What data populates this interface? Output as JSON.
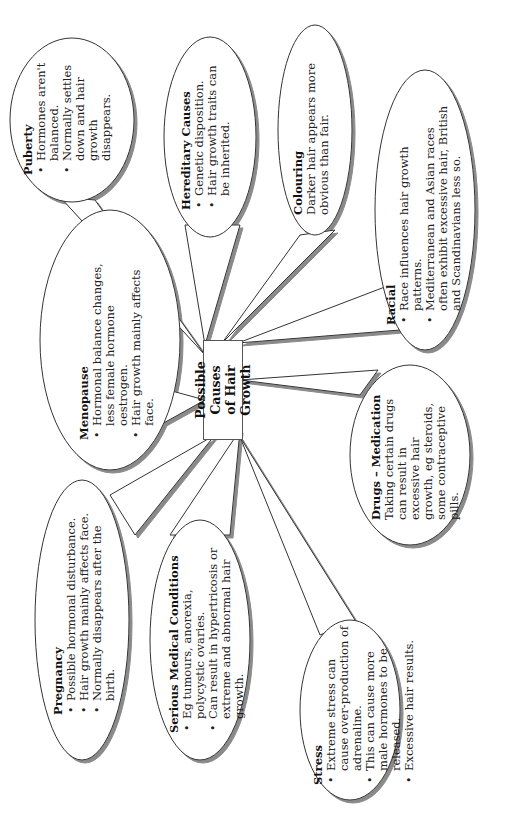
{
  "center": {
    "line1": "Possible Causes",
    "line2": "of Hair Growth"
  },
  "bubbles": {
    "puberty": {
      "title": "Puberty",
      "bullets": [
        "Hormones aren't balanced.",
        "Normally settles down and hair growth disappears."
      ]
    },
    "hereditary": {
      "title": "Hereditary Causes",
      "bullets": [
        "Genetic disposition.",
        "Hair growth traits can be inherited."
      ]
    },
    "colouring": {
      "title": "Colouring",
      "text": "Darker hair appears more obvious than fair."
    },
    "racial": {
      "title": "Racial",
      "bullets": [
        "Race influences hair growth patterns.",
        "Mediterranean and Asian races often exhibit excessive hair, British and Scandinavians less so."
      ]
    },
    "drugs": {
      "title": "Drugs – Medication",
      "text": "Taking certain drugs can result in excessive hair growth, eg steroids, some contraceptive pills."
    },
    "stress": {
      "title": "Stress",
      "bullets": [
        "Extreme stress can cause over-production of adrenaline.",
        "This can cause more male hormones to be released.",
        "Excessive hair results."
      ]
    },
    "serious": {
      "title": "Serious Medical Conditions",
      "bullets": [
        "Eg tumours, anorexia, polycystic ovaries.",
        "Can result in hypertricosis or extreme and abnormal hair growth."
      ]
    },
    "pregnancy": {
      "title": "Pregnancy",
      "bullets": [
        "Possible hormonal disturbance.",
        "Hair growth mainly affects face.",
        "Normally disappears after the birth."
      ]
    },
    "menopause": {
      "title": "Menopause",
      "bullets": [
        "Hormonal balance changes, less female hormone oestrogen.",
        "Hair growth mainly affects face."
      ]
    }
  },
  "colors": {
    "outline": "#333333",
    "shadow": "#8a8a8a",
    "background": "#ffffff"
  }
}
